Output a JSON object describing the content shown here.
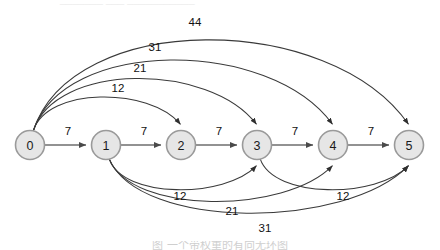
{
  "figure": {
    "node_radius": 14.5,
    "colors": {
      "node_fill": "#e6e6e6",
      "node_stroke": "#9a9a9a",
      "edge_stroke": "#3a3a3a",
      "spine_stroke": "#6e6e6e",
      "text": "#111111",
      "background": "#ffffff"
    }
  },
  "top_strip": {
    "text": "_______  ___  ___________"
  },
  "caption": {
    "text": "图        一个带权重的有向无环图"
  },
  "chart_data": {
    "type": "diagram",
    "subtype": "weighted-directed-graph",
    "nodes": [
      {
        "id": "0",
        "label": "0",
        "cx": 30,
        "cy": 145
      },
      {
        "id": "1",
        "label": "1",
        "cx": 106,
        "cy": 145
      },
      {
        "id": "2",
        "label": "2",
        "cx": 181,
        "cy": 145
      },
      {
        "id": "3",
        "label": "3",
        "cx": 257,
        "cy": 145
      },
      {
        "id": "4",
        "label": "4",
        "cx": 333,
        "cy": 145
      },
      {
        "id": "5",
        "label": "5",
        "cx": 409,
        "cy": 145
      }
    ],
    "edges": [
      {
        "id": "e01",
        "from": "0",
        "to": "1",
        "weight": 7,
        "label": "7",
        "side": "straight",
        "label_x": 68,
        "label_y": 131
      },
      {
        "id": "e12",
        "from": "1",
        "to": "2",
        "weight": 7,
        "label": "7",
        "side": "straight",
        "label_x": 144,
        "label_y": 131
      },
      {
        "id": "e23",
        "from": "2",
        "to": "3",
        "weight": 7,
        "label": "7",
        "side": "straight",
        "label_x": 219,
        "label_y": 131
      },
      {
        "id": "e34",
        "from": "3",
        "to": "4",
        "weight": 7,
        "label": "7",
        "side": "straight",
        "label_x": 295,
        "label_y": 131
      },
      {
        "id": "e45",
        "from": "4",
        "to": "5",
        "weight": 7,
        "label": "7",
        "side": "straight",
        "label_x": 371,
        "label_y": 131
      },
      {
        "id": "e02",
        "from": "0",
        "to": "2",
        "weight": 12,
        "label": "12",
        "side": "top",
        "arc_height": 52,
        "label_x": 118,
        "label_y": 88
      },
      {
        "id": "e03",
        "from": "0",
        "to": "3",
        "weight": 21,
        "label": "21",
        "side": "top",
        "arc_height": 74,
        "label_x": 140,
        "label_y": 68
      },
      {
        "id": "e04",
        "from": "0",
        "to": "4",
        "weight": 31,
        "label": "31",
        "side": "top",
        "arc_height": 96,
        "label_x": 155,
        "label_y": 47
      },
      {
        "id": "e05",
        "from": "0",
        "to": "5",
        "weight": 44,
        "label": "44",
        "side": "top",
        "arc_height": 120,
        "label_x": 195,
        "label_y": 22
      },
      {
        "id": "e13",
        "from": "1",
        "to": "3",
        "weight": 12,
        "label": "12",
        "side": "bottom",
        "arc_height": 48,
        "label_x": 180,
        "label_y": 196
      },
      {
        "id": "e14",
        "from": "1",
        "to": "4",
        "weight": 21,
        "label": "21",
        "side": "bottom",
        "arc_height": 62,
        "label_x": 232,
        "label_y": 211
      },
      {
        "id": "e15",
        "from": "1",
        "to": "5",
        "weight": 31,
        "label": "31",
        "side": "bottom",
        "arc_height": 76,
        "label_x": 265,
        "label_y": 228
      },
      {
        "id": "e35",
        "from": "3",
        "to": "5",
        "weight": 12,
        "label": "12",
        "side": "bottom",
        "arc_height": 48,
        "label_x": 343,
        "label_y": 196
      }
    ],
    "weights_legend": {
      "sequential_weight": 7,
      "skip_weights": [
        12,
        21,
        31,
        44
      ]
    },
    "layout": {
      "orientation": "left-to-right",
      "node_row_y": 145,
      "top_arcs_from": "0",
      "bottom_arcs_from": "1"
    }
  }
}
